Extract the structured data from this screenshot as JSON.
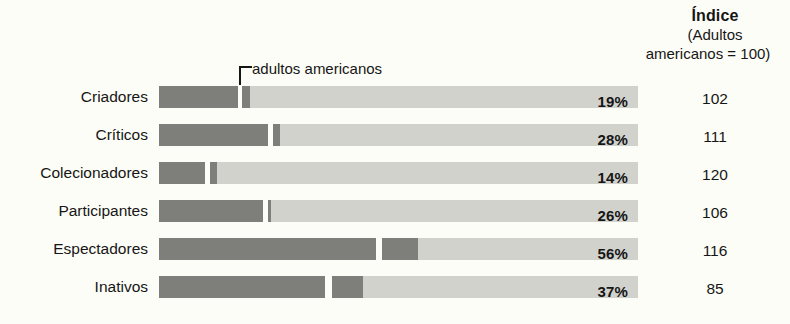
{
  "annotation": {
    "callout_label": "adultos americanos"
  },
  "index_header": {
    "title": "Índice",
    "line2": "(Adultos",
    "line3": "americanos = 100)"
  },
  "chart_data": {
    "type": "bar",
    "title": "",
    "subtitle": "",
    "xlabel": "",
    "ylabel": "",
    "orientation": "horizontal",
    "grid": false,
    "legend": "none",
    "xlim": [
      0,
      100
    ],
    "annotations": [
      {
        "text": "adultos americanos",
        "points_to": "marcador de referência dos adultos americanos em cada barra"
      }
    ],
    "columns": [
      "Categoria",
      "%",
      "Índice (Adultos americanos = 100)"
    ],
    "categories": [
      "Criadores",
      "Críticos",
      "Colecionadores",
      "Participantes",
      "Espectadores",
      "Inativos"
    ],
    "series": [
      {
        "name": "Percentagem",
        "values": [
          19,
          28,
          14,
          26,
          56,
          37
        ]
      },
      {
        "name": "Índice",
        "values": [
          102,
          111,
          120,
          106,
          116,
          85
        ]
      }
    ],
    "rows": [
      {
        "label": "Criadores",
        "pct": 19,
        "pct_label": "19%",
        "index": 102,
        "index_label": "102",
        "fill_end": 16.5,
        "marker_start": 17.3,
        "marker_end": 19.0
      },
      {
        "label": "Críticos",
        "pct": 28,
        "pct_label": "28%",
        "index": 111,
        "index_label": "111",
        "fill_end": 22.8,
        "marker_start": 23.8,
        "marker_end": 25.3
      },
      {
        "label": "Colecionadores",
        "pct": 14,
        "pct_label": "14%",
        "index": 120,
        "index_label": "120",
        "fill_end": 9.6,
        "marker_start": 10.6,
        "marker_end": 12.1
      },
      {
        "label": "Participantes",
        "pct": 26,
        "pct_label": "26%",
        "index": 106,
        "index_label": "106",
        "fill_end": 21.7,
        "marker_start": 22.7,
        "marker_end": 23.4
      },
      {
        "label": "Espectadores",
        "pct": 56,
        "pct_label": "56%",
        "index": 116,
        "index_label": "116",
        "fill_end": 45.3,
        "marker_start": 46.5,
        "marker_end": 54.0
      },
      {
        "label": "Inativos",
        "pct": 37,
        "pct_label": "37%",
        "index": 85,
        "index_label": "85",
        "fill_end": 34.7,
        "marker_start": 36.2,
        "marker_end": 42.6
      }
    ],
    "colors": {
      "bar_dark": "#7e7e7b",
      "bar_light": "#d2d2cd",
      "background": "#fdfdf7",
      "text": "#161616"
    }
  }
}
